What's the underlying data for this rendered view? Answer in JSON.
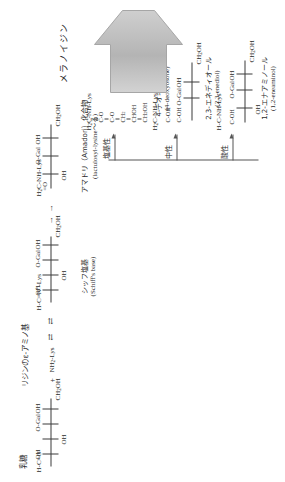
{
  "figure": {
    "title_arrow_label": "メラノイジン",
    "orientation": "rotated-90",
    "reactants": {
      "lactose_label": "乳糖",
      "amine_label": "リジンのε-アミノ基",
      "plus": "+",
      "amine_formula": "NH2-Lys",
      "equilibrium_1": "⇄",
      "equilibrium_2": "⇄",
      "arrow_1": "→",
      "arrow_2": "→"
    },
    "structures": [
      {
        "id": "lactose",
        "name_jp": "乳糖",
        "name_en": "",
        "top": "H-C=O",
        "rows": [
          "OH",
          "OH",
          "O-Gal",
          "OH"
        ],
        "bottom": "CH2OH"
      },
      {
        "id": "schiff-base",
        "name_jp": "シッフ塩基",
        "name_en": "(Schiff's base)",
        "top": "H-C=N+-Lys",
        "rows": [
          "OH",
          "OH",
          "O-Gal",
          "OH"
        ],
        "bottom": "CH2OH"
      },
      {
        "id": "amadori",
        "name_jp": "アマドリ（Amadori）化合物",
        "name_en": "(lactulosyl-lysine～る)",
        "top": "H2C-NH-Lys",
        "carbonyl": "=O",
        "rows": [
          "OH",
          "O-Gal",
          "OH"
        ],
        "bottom": "CH2OH"
      },
      {
        "id": "eneaminol",
        "name_jp": "1,2-エナアミノール",
        "name_en": "(1,2-eneaminol)",
        "branch": "酸性",
        "top": "H-C-NH-Lys",
        "second": "C-OH",
        "rows": [
          "OH",
          "O-Gal",
          "OH"
        ],
        "bottom": "CH2OH"
      },
      {
        "id": "enediol",
        "name_jp": "2,3-エネディオール",
        "name_en": "(2,3-enediol)",
        "branch": "中性",
        "top": "H2C-NH-Lys",
        "second": "C-OH",
        "third": "C-OH",
        "rows": [
          "O-Gal",
          "OH"
        ],
        "bottom": "CH2OH"
      },
      {
        "id": "deoxyosone",
        "name_jp": "4-デオキシオソン",
        "name_en": "(4-deoxyosone)",
        "branch": "塩基性",
        "top": "H2C-NH-Lys",
        "linear": [
          "C-O",
          "C-O",
          "CH2",
          "CHOH",
          "CH2OH"
        ]
      }
    ],
    "branch_labels": {
      "acidic": "酸性",
      "neutral": "中性",
      "basic": "塩基性"
    },
    "colors": {
      "ink": "#2b2b2b",
      "line": "#3a3a3a",
      "arrow_fill": "#b9b9b9",
      "arrow_stroke": "#a0a0a0"
    }
  }
}
